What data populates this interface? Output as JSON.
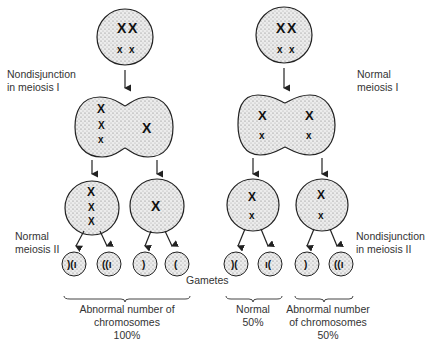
{
  "diagram": {
    "title": "Nondisjunction in meiosis",
    "left_branch": {
      "label_meiosis_I": "Nondisjunction\nin meiosis I",
      "label_meiosis_II": "Normal\nmeiosis II",
      "outcome": {
        "line1": "Abnormal number of",
        "line2": "chromosomes",
        "percent": "100%"
      }
    },
    "right_branch": {
      "label_meiosis_I": "Normal\nmeiosis I",
      "label_meiosis_II": "Nondisjunction\nin meiosis II",
      "outcome_normal": {
        "line1": "Normal",
        "percent": "50%"
      },
      "outcome_abnormal": {
        "line1": "Abnormal number",
        "line2": "of chromosomes",
        "percent": "50%"
      }
    },
    "gametes_label": "Gametes",
    "colors": {
      "cell_fill": "#d9d9d9",
      "outline": "#222222",
      "text": "#333333"
    }
  }
}
